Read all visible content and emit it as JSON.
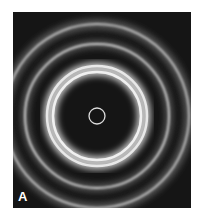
{
  "figure": {
    "panel_label": "A",
    "colors": {
      "background": "#151515",
      "ring": "#e8e8e8"
    }
  }
}
